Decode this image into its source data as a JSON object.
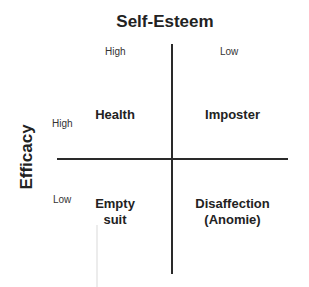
{
  "diagram": {
    "type": "2x2 matrix",
    "top_axis": {
      "title": "Self-Esteem",
      "left_label": "High",
      "right_label": "Low"
    },
    "left_axis": {
      "title": "Efficacy",
      "top_label": "High",
      "bottom_label": "Low"
    },
    "quadrants": {
      "top_left": "Health",
      "top_right": "Imposter",
      "bottom_left_line1": "Empty",
      "bottom_left_line2": "suit",
      "bottom_right_line1": "Disaffection",
      "bottom_right_line2": "(Anomie)"
    },
    "colors": {
      "text": "#222222",
      "lines": "#2a2a2a",
      "background": "#ffffff"
    }
  }
}
